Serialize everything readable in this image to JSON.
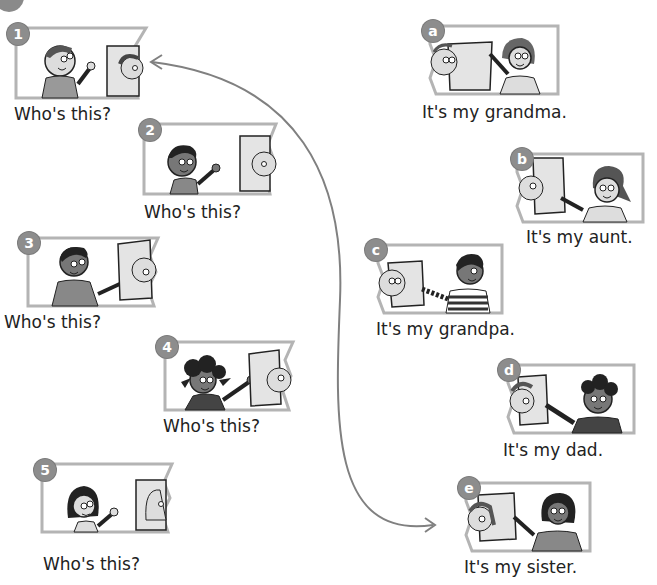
{
  "exercise": {
    "left_column": {
      "items": [
        {
          "number": "1",
          "question": "Who's this?",
          "speaker": "boy with brown hair",
          "photo": "girl with ponytail"
        },
        {
          "number": "2",
          "question": "Who's this?",
          "speaker": "boy with curly hair",
          "photo": "bald man"
        },
        {
          "number": "3",
          "question": "Who's this?",
          "speaker": "boy",
          "photo": "man with curly hair and glasses"
        },
        {
          "number": "4",
          "question": "Who's this?",
          "speaker": "girl with curly pigtails",
          "photo": "man"
        },
        {
          "number": "5",
          "question": "Who's this?",
          "speaker": "girl with dark hair",
          "photo": "woman"
        }
      ]
    },
    "right_column": {
      "items": [
        {
          "letter": "a",
          "answer": "It's my grandma.",
          "speaker": "woman",
          "photo": "grandma with glasses"
        },
        {
          "letter": "b",
          "answer": "It's my aunt.",
          "speaker": "girl with ponytail",
          "photo": "woman"
        },
        {
          "letter": "c",
          "answer": "It's my grandpa.",
          "speaker": "boy in striped shirt",
          "photo": "bald man"
        },
        {
          "letter": "d",
          "answer": "It's my dad.",
          "speaker": "boy with curly hair",
          "photo": "man"
        },
        {
          "letter": "e",
          "answer": "It's my sister.",
          "speaker": "girl with dark hair",
          "photo": "girl with ponytail"
        }
      ]
    },
    "connector": {
      "from": "1",
      "to": "e",
      "style": "curved double-headed arrow",
      "color": "#808080"
    },
    "colors": {
      "frame_border": "#b4b4b4",
      "badge_fill": "#8d8d8d",
      "text": "#222222"
    }
  }
}
